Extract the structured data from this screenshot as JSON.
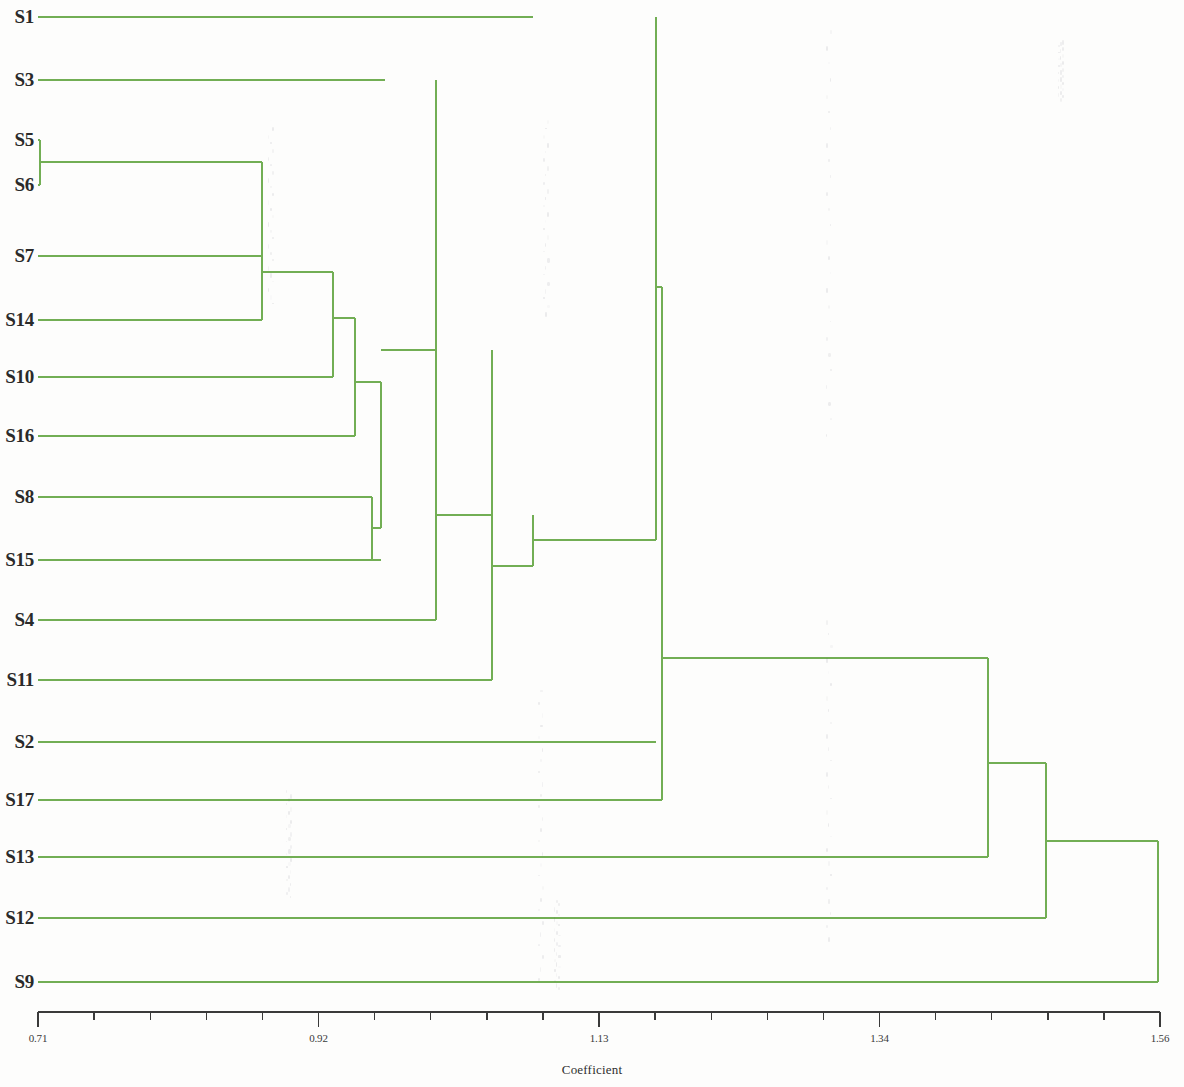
{
  "figure": {
    "kind": "dendrogram",
    "line_color": "#72ae54",
    "axis_color": "#3a3a3a",
    "background": "#fdfdfc"
  },
  "axis": {
    "title": "Coefficient",
    "tick_labels": [
      "0.71",
      "0.92",
      "1.13",
      "1.34",
      "1.56"
    ],
    "tick_values": [
      0.71,
      0.92,
      1.13,
      1.34,
      1.56
    ],
    "minor_ticks_between": 4,
    "min": 0.71,
    "max": 1.56,
    "pixel_min": 38,
    "pixel_max": 1160,
    "baseline_y": 1012
  },
  "leaves": [
    {
      "label": "S1",
      "y": 17,
      "x_end": 533
    },
    {
      "label": "S3",
      "y": 80,
      "x_end": 385
    },
    {
      "label": "S5",
      "y": 140,
      "x_end": 40
    },
    {
      "label": "S6",
      "y": 185,
      "x_end": 40
    },
    {
      "label": "S7",
      "y": 256,
      "x_end": 262
    },
    {
      "label": "S14",
      "y": 320,
      "x_end": 262
    },
    {
      "label": "S10",
      "y": 377,
      "x_end": 333
    },
    {
      "label": "S16",
      "y": 436,
      "x_end": 355
    },
    {
      "label": "S8",
      "y": 497,
      "x_end": 372
    },
    {
      "label": "S15",
      "y": 560,
      "x_end": 381
    },
    {
      "label": "S4",
      "y": 620,
      "x_end": 436
    },
    {
      "label": "S11",
      "y": 680,
      "x_end": 492
    },
    {
      "label": "S2",
      "y": 742,
      "x_end": 656
    },
    {
      "label": "S17",
      "y": 800,
      "x_end": 662
    },
    {
      "label": "S13",
      "y": 857,
      "x_end": 988
    },
    {
      "label": "S12",
      "y": 918,
      "x_end": 1046
    },
    {
      "label": "S9",
      "y": 982,
      "x_end": 1158
    }
  ],
  "chart_data": {
    "type": "dendrogram",
    "title": "",
    "xlabel": "Coefficient",
    "ylabel": "",
    "xlim": [
      0.71,
      1.56
    ],
    "grid": false,
    "legend": "none",
    "labels": [
      "S1",
      "S3",
      "S5",
      "S6",
      "S7",
      "S14",
      "S10",
      "S16",
      "S8",
      "S15",
      "S4",
      "S11",
      "S2",
      "S17",
      "S13",
      "S12",
      "S9"
    ],
    "leaf_order": [
      "S1",
      "S3",
      "S5",
      "S6",
      "S7",
      "S14",
      "S10",
      "S16",
      "S8",
      "S15",
      "S4",
      "S11",
      "S2",
      "S17",
      "S13",
      "S12",
      "S9"
    ],
    "merges": [
      {
        "id": "n1",
        "members": [
          "S5",
          "S6"
        ],
        "coefficient": 0.71,
        "x": 40,
        "y_top": 140,
        "y_bottom": 185
      },
      {
        "id": "n2",
        "members": [
          "S7",
          "S14",
          "S5",
          "S6"
        ],
        "coefficient": 0.88,
        "x": 262,
        "y_top": 162,
        "y_bottom": 320
      },
      {
        "id": "n3",
        "members": [
          "S7",
          "S14",
          "S5",
          "S6",
          "S10"
        ],
        "coefficient": 0.93,
        "x": 333,
        "y_top": 272,
        "y_bottom": 377
      },
      {
        "id": "n4",
        "members": [
          "S7",
          "S14",
          "S5",
          "S6",
          "S10",
          "S16"
        ],
        "coefficient": 0.95,
        "x": 355,
        "y_top": 318,
        "y_bottom": 436
      },
      {
        "id": "n5",
        "members": [
          "S8",
          "S15"
        ],
        "coefficient": 0.96,
        "x": 372,
        "y_top": 497,
        "y_bottom": 560
      },
      {
        "id": "n6",
        "members": [
          "S7",
          "S14",
          "S5",
          "S6",
          "S10",
          "S16",
          "S8",
          "S15"
        ],
        "coefficient": 0.97,
        "x": 381,
        "y_top": 382,
        "y_bottom": 528
      },
      {
        "id": "n7",
        "members": [
          "S3",
          "cluster-n6"
        ],
        "coefficient": 1.02,
        "x": 436,
        "y_top": 80,
        "y_bottom": 620
      },
      {
        "id": "n8",
        "members": [
          "S4",
          "cluster-n7"
        ],
        "coefficient": 1.06,
        "x": 492,
        "y_top": 350,
        "y_bottom": 680
      },
      {
        "id": "n9",
        "members": [
          "S11",
          "cluster-n8"
        ],
        "coefficient": 1.09,
        "x": 533,
        "y_top": 515,
        "y_bottom": 566
      },
      {
        "id": "n10",
        "members": [
          "S1",
          "cluster-n9"
        ],
        "coefficient": 1.12,
        "x": 656,
        "y_top": 17,
        "y_bottom": 540
      },
      {
        "id": "n11",
        "members": [
          "S2",
          "cluster-n10"
        ],
        "coefficient": 1.16,
        "x": 662,
        "y_top": 287,
        "y_bottom": 742
      },
      {
        "id": "n12",
        "members": [
          "S17",
          "cluster-n11"
        ],
        "coefficient": 1.17,
        "x": 662,
        "y_top": 515,
        "y_bottom": 800
      },
      {
        "id": "n13",
        "members": [
          "S13",
          "cluster-n12"
        ],
        "coefficient": 1.39,
        "x": 988,
        "y_top": 658,
        "y_bottom": 857
      },
      {
        "id": "n14",
        "members": [
          "S12",
          "cluster-n13"
        ],
        "coefficient": 1.44,
        "x": 1046,
        "y_top": 763,
        "y_bottom": 918
      },
      {
        "id": "n15",
        "members": [
          "S9",
          "cluster-n14"
        ],
        "coefficient": 1.53,
        "x": 1158,
        "y_top": 841,
        "y_bottom": 982
      }
    ]
  }
}
